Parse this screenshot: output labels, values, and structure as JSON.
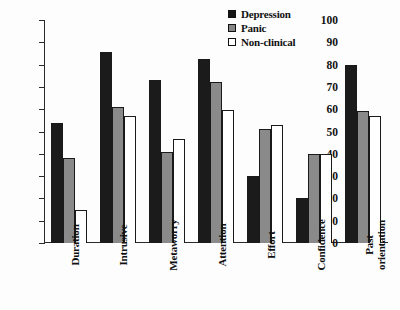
{
  "chart_data": {
    "type": "bar",
    "title": "",
    "xlabel": "",
    "ylabel": "",
    "ylim": [
      0,
      100
    ],
    "yticks": [
      0,
      10,
      20,
      30,
      40,
      50,
      60,
      70,
      80,
      90,
      100
    ],
    "grid": false,
    "legend_position": "top-right",
    "categories": [
      "Duration",
      "Intrusive",
      "Metaworry",
      "Attention",
      "Effort",
      "Confidence",
      "Past orientation"
    ],
    "series": [
      {
        "name": "Depression",
        "color": "#1b1b1b",
        "values": [
          54,
          85.5,
          73,
          82.5,
          30,
          20,
          80
        ]
      },
      {
        "name": "Panic",
        "color": "#8a8a8a",
        "values": [
          38,
          61,
          41,
          72,
          51,
          40,
          59
        ]
      },
      {
        "name": "Non-clinical",
        "color": "#ffffff",
        "values": [
          15,
          57,
          46.5,
          59.5,
          53,
          40,
          57
        ]
      }
    ]
  },
  "legend": {
    "items": [
      {
        "label": "Depression",
        "swatch": "black-square-icon"
      },
      {
        "label": "Panic",
        "swatch": "gray-square-icon"
      },
      {
        "label": "Non-clinical",
        "swatch": "white-square-icon"
      }
    ]
  },
  "axis": {
    "y_tick_labels": [
      "0",
      "10",
      "20",
      "30",
      "40",
      "50",
      "60",
      "70",
      "80",
      "90",
      "100"
    ],
    "x_tick_labels": [
      "Duration",
      "Intrusive",
      "Metaworry",
      "Attention",
      "Effort",
      "Confidence",
      "Past orientation"
    ]
  }
}
